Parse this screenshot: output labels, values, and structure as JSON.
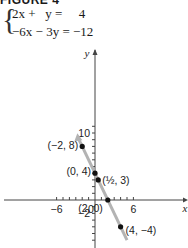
{
  "figure": {
    "title": "FIGURE 4",
    "equations": [
      "2x +   y =     4",
      "−6x − 3y = −12"
    ]
  },
  "chart_data": {
    "type": "line",
    "title": "FIGURE 4",
    "system": [
      "2x + y = 4",
      "-6x - 3y = -12"
    ],
    "xlabel": "x",
    "ylabel": "y",
    "xlim": [
      -7,
      7
    ],
    "ylim": [
      -4,
      12
    ],
    "x_ticks": [
      -6,
      0,
      6
    ],
    "y_ticks": [
      10,
      -2
    ],
    "x_tick_labels": [
      "−6",
      "0",
      "6"
    ],
    "y_tick_labels": [
      "10",
      "−2"
    ],
    "grid": false,
    "series": [
      {
        "name": "y = -2x + 4",
        "color": "#b3b3b3",
        "points": [
          {
            "x": -2,
            "y": 8,
            "label": "(−2, 8)"
          },
          {
            "x": 0,
            "y": 4,
            "label": "(0, 4)"
          },
          {
            "x": 0.5,
            "y": 3,
            "label": "(½, 3)"
          },
          {
            "x": 2,
            "y": 0,
            "label": "(2, 0)"
          },
          {
            "x": 4,
            "y": -4,
            "label": "(4, −4)"
          }
        ]
      }
    ],
    "colors": {
      "line": "#b3b3b3",
      "axes": "#444444",
      "points": "#111111"
    }
  }
}
